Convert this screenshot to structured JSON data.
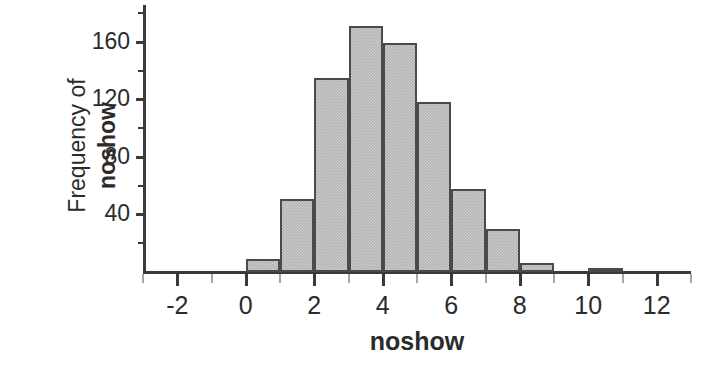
{
  "chart_data": {
    "type": "bar",
    "title": "",
    "subtitle": "",
    "xlabel": "noshow",
    "ylabel_regular": "Frequency of",
    "ylabel_bold": "noshow",
    "ylabel": "Frequency of noshow",
    "grid": false,
    "legend": "none",
    "xlim": [
      -3,
      13
    ],
    "ylim": [
      0,
      180
    ],
    "xticks": [
      -2,
      0,
      2,
      4,
      6,
      8,
      10,
      12
    ],
    "xtick_labels": [
      "-2",
      "0",
      "2",
      "4",
      "6",
      "8",
      "10",
      "12"
    ],
    "xticks_minor": [
      -3,
      -1,
      1,
      3,
      5,
      7,
      9,
      11,
      13
    ],
    "yticks": [
      40,
      80,
      120,
      160
    ],
    "ytick_labels": [
      "40",
      "80",
      "120",
      "160"
    ],
    "yticks_minor": [
      20,
      60,
      100,
      140,
      180
    ],
    "bin_width": 1,
    "bar_fill_color": "#b3b3b3",
    "bar_edge_color": "#4a4a4a",
    "axis_color": "#3a3a3a",
    "text_color": "#2b2b2b",
    "bins": [
      {
        "x_start": 0,
        "x_end": 1,
        "value": 9
      },
      {
        "x_start": 1,
        "x_end": 2,
        "value": 51
      },
      {
        "x_start": 2,
        "x_end": 3,
        "value": 135
      },
      {
        "x_start": 3,
        "x_end": 4,
        "value": 171
      },
      {
        "x_start": 4,
        "x_end": 5,
        "value": 159
      },
      {
        "x_start": 5,
        "x_end": 6,
        "value": 118
      },
      {
        "x_start": 6,
        "x_end": 7,
        "value": 58
      },
      {
        "x_start": 7,
        "x_end": 8,
        "value": 30
      },
      {
        "x_start": 8,
        "x_end": 9,
        "value": 6
      },
      {
        "x_start": 10,
        "x_end": 11,
        "value": 3
      }
    ],
    "categories": [
      "0-1",
      "1-2",
      "2-3",
      "3-4",
      "4-5",
      "5-6",
      "6-7",
      "7-8",
      "8-9",
      "10-11"
    ],
    "values": [
      9,
      51,
      135,
      171,
      159,
      118,
      58,
      30,
      6,
      3
    ]
  }
}
